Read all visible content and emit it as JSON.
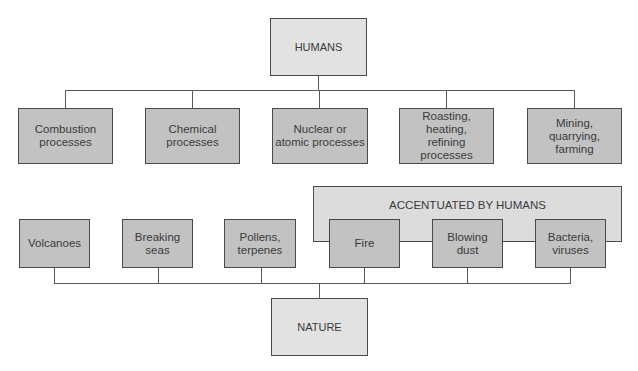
{
  "diagram": {
    "top_node": {
      "label": "HUMANS"
    },
    "bottom_node": {
      "label": "NATURE"
    },
    "human_sources": [
      {
        "label": "Combustion\nprocesses"
      },
      {
        "label": "Chemical\nprocesses"
      },
      {
        "label": "Nuclear or\natomic processes"
      },
      {
        "label": "Roasting,\nheating,\nrefining\nprocesses"
      },
      {
        "label": "Mining,\nquarrying,\nfarming"
      }
    ],
    "accentuated_group": {
      "label": "ACCENTUATED BY HUMANS"
    },
    "natural_sources": [
      {
        "label": "Volcanoes"
      },
      {
        "label": "Breaking\nseas"
      },
      {
        "label": "Pollens,\nterpenes"
      },
      {
        "label": "Fire"
      },
      {
        "label": "Blowing\ndust"
      },
      {
        "label": "Bacteria,\nviruses"
      }
    ],
    "colors": {
      "root_fill": "#e2e2e2",
      "source_fill": "#c2c2c2",
      "group_fill": "#dcdcdc",
      "stroke": "#4a4a4a"
    }
  }
}
